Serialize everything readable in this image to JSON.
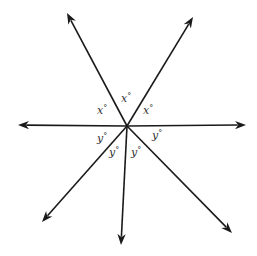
{
  "diagram": {
    "type": "intersecting-rays",
    "center": {
      "x": 127,
      "y": 126
    },
    "colors": {
      "line": "#1a1a1a",
      "text": "#333333",
      "background": "#ffffff"
    },
    "rays": [
      {
        "name": "ray-upper-left",
        "x": 67,
        "y": 13
      },
      {
        "name": "ray-upper-right",
        "x": 193,
        "y": 17
      },
      {
        "name": "ray-left",
        "x": 18,
        "y": 125
      },
      {
        "name": "ray-right",
        "x": 246,
        "y": 125
      },
      {
        "name": "ray-lower-left",
        "x": 42,
        "y": 222
      },
      {
        "name": "ray-bottom",
        "x": 121,
        "y": 245
      },
      {
        "name": "ray-lower-right",
        "x": 232,
        "y": 233
      }
    ],
    "labels": [
      {
        "name": "angle-label-x-top",
        "var": "x",
        "deg": "°",
        "x": 121,
        "y": 102
      },
      {
        "name": "angle-label-x-left",
        "var": "x",
        "deg": "°",
        "x": 97,
        "y": 114
      },
      {
        "name": "angle-label-x-right",
        "var": "x",
        "deg": "°",
        "x": 143,
        "y": 114
      },
      {
        "name": "angle-label-y-left",
        "var": "y",
        "deg": "°",
        "x": 97,
        "y": 142
      },
      {
        "name": "angle-label-y-lower-left",
        "var": "y",
        "deg": "°",
        "x": 109,
        "y": 156
      },
      {
        "name": "angle-label-y-lower-right",
        "var": "y",
        "deg": "°",
        "x": 131,
        "y": 156
      },
      {
        "name": "angle-label-y-right",
        "var": "y",
        "deg": "°",
        "x": 152,
        "y": 139
      }
    ]
  }
}
